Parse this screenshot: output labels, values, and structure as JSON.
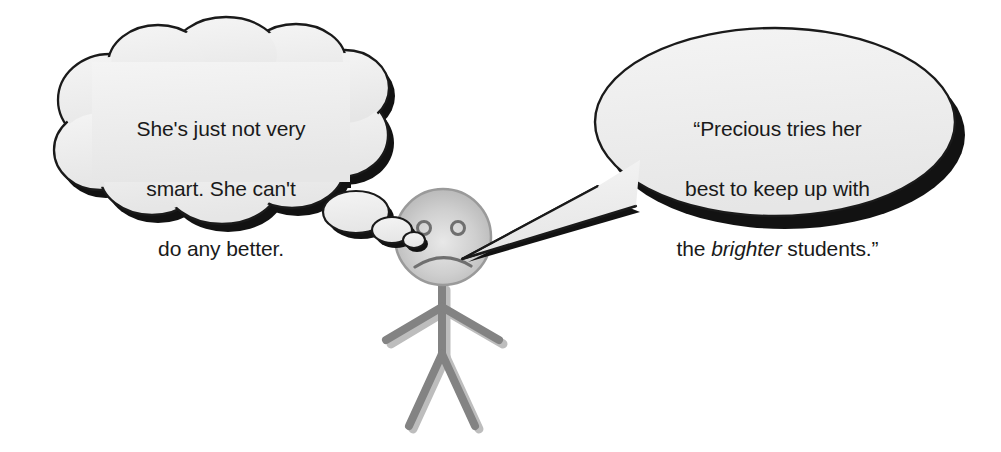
{
  "scene": {
    "title": "Teacher thought and speech cartoon",
    "background_color": "#ffffff",
    "width": 1001,
    "height": 452
  },
  "thought_bubble": {
    "name": "thought-bubble",
    "text": "She's just not very smart. She can't do any better.",
    "line_1": "She's just not very",
    "line_2": "smart. She can't",
    "line_3": "do any better.",
    "fill_color": "#f0f0f0",
    "outline_color": "#1a1a1a",
    "shadow_color": "#111111",
    "trail_dot_count": 3
  },
  "speech_bubble": {
    "name": "speech-bubble",
    "text": "“Precious tries her best to keep up with the brighter students.”",
    "line_1": "“Precious tries her",
    "line_2": "best to keep up with",
    "line_3_before": "the ",
    "line_3_italic": "brighter",
    "line_3_after": " students.”",
    "fill_color": "#f0f0f0",
    "outline_color": "#1a1a1a",
    "shadow_color": "#111111"
  },
  "character": {
    "name": "stick-figure",
    "head_fill": "#c9c9c9",
    "limb_color": "#808080",
    "limb_shadow_color": "#b8b8b8",
    "expression": "frowning",
    "eye_count": 2
  }
}
